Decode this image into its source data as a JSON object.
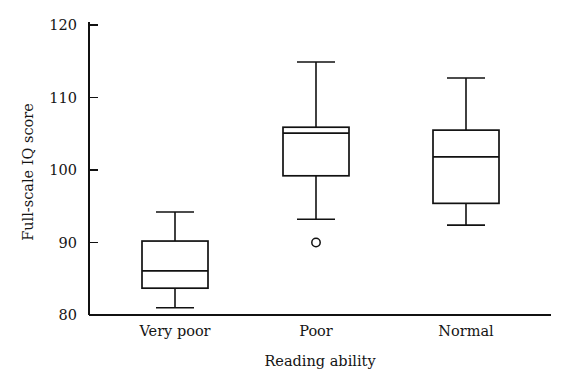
{
  "chart_data": {
    "type": "box",
    "title": "",
    "xlabel": "Reading ability",
    "ylabel": "Full-scale IQ score",
    "categories": [
      "Very poor",
      "Poor",
      "Normal"
    ],
    "ylim": [
      80,
      120
    ],
    "yticks": [
      80,
      90,
      100,
      110,
      120
    ],
    "ytick_labels": [
      "80",
      "90",
      "100",
      "110",
      "120"
    ],
    "grid": false,
    "legend": false,
    "boxes": [
      {
        "category": "Very poor",
        "whisker_low": 81.0,
        "q1": 83.7,
        "median": 86.1,
        "q3": 90.2,
        "whisker_high": 94.2,
        "outliers": []
      },
      {
        "category": "Poor",
        "whisker_low": 93.2,
        "q1": 99.2,
        "median": 105.1,
        "q3": 105.9,
        "whisker_high": 114.9,
        "outliers": [
          90.0
        ]
      },
      {
        "category": "Normal",
        "whisker_low": 92.4,
        "q1": 95.4,
        "median": 101.8,
        "q3": 105.5,
        "whisker_high": 112.7,
        "outliers": []
      }
    ]
  },
  "colors": {
    "ink": "#111111",
    "background": "#ffffff",
    "box_fill": "#ffffff"
  }
}
